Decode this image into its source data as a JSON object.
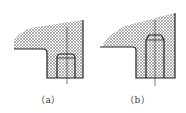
{
  "figures": [
    {
      "id": "a",
      "caption": "（a）",
      "description": "hatched part with slanted top, pin with rounded top inside stepped hole"
    },
    {
      "id": "b",
      "caption": "（b）",
      "description": "hatched part with slanted top, taller pin with chamfered top inside stepped hole"
    }
  ],
  "colors": {
    "line": "#222222",
    "hatch": "#555555",
    "background": "#ffffff"
  }
}
